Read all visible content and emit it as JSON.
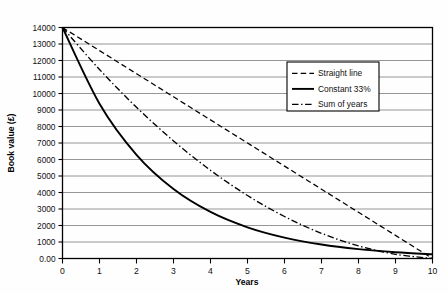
{
  "chart_data": {
    "type": "line",
    "title": "",
    "xlabel": "Years",
    "ylabel": "Book value (£)",
    "xlim": [
      0,
      10
    ],
    "ylim": [
      0,
      14000
    ],
    "grid": "horizontal",
    "legend_position": "upper-right-inside",
    "x": [
      0,
      1,
      2,
      3,
      4,
      5,
      6,
      7,
      8,
      9,
      10
    ],
    "xticklabels": [
      "0",
      "1",
      "2",
      "3",
      "4",
      "5",
      "6",
      "7",
      "8",
      "9",
      "10"
    ],
    "yticks": [
      0,
      1000,
      2000,
      3000,
      4000,
      5000,
      6000,
      7000,
      8000,
      9000,
      10000,
      11000,
      12000,
      13000,
      14000
    ],
    "yticklabels": [
      "0.00",
      "1000",
      "2000",
      "3000",
      "4000",
      "5000",
      "6000",
      "7000",
      "8000",
      "9000",
      "10000",
      "11000",
      "12000",
      "13000",
      "14000"
    ],
    "series": [
      {
        "name": "Straight line",
        "style": "dashed",
        "color": "#000000",
        "values": [
          14000,
          12600,
          11200,
          9800,
          8400,
          7000,
          5600,
          4200,
          2800,
          1400,
          0
        ]
      },
      {
        "name": "Constant 33%",
        "style": "solid",
        "color": "#000000",
        "values": [
          14000,
          9380,
          6285,
          4211,
          2821,
          1890,
          1267,
          849,
          569,
          381,
          255
        ]
      },
      {
        "name": "Sum of years",
        "style": "dash-dot",
        "color": "#000000",
        "values": [
          14000,
          11455,
          9164,
          7127,
          5345,
          3818,
          2545,
          1527,
          764,
          255,
          0
        ]
      }
    ]
  },
  "legend": {
    "items": [
      {
        "label": "Straight line",
        "style": "dashed"
      },
      {
        "label": "Constant 33%",
        "style": "solid"
      },
      {
        "label": "Sum of years",
        "style": "dash-dot"
      }
    ]
  }
}
